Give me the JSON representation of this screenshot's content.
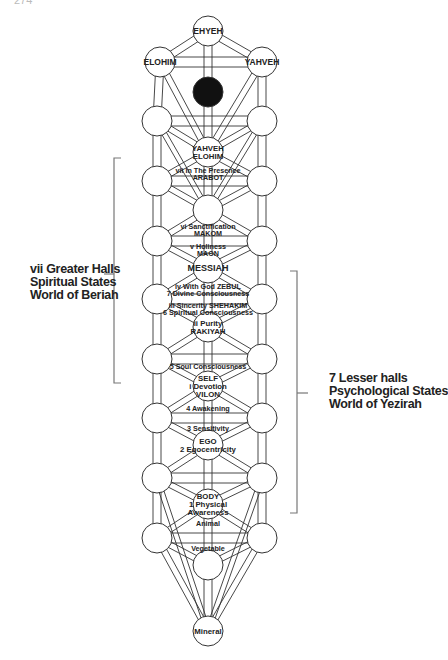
{
  "page_number": "274",
  "diagram": {
    "type": "tree-of-life",
    "top_nodes": {
      "crown": "EHYEH",
      "left": "ELOHIM",
      "right": "YAHVEH"
    },
    "center_nodes": [
      {
        "id": "yahveh-elohim",
        "lines": [
          "YAHVEH",
          "ELOHIM"
        ]
      },
      {
        "id": "blank-1",
        "lines": []
      },
      {
        "id": "messiah",
        "lines": [
          "MESSIAH"
        ]
      },
      {
        "id": "rakiyah",
        "lines": [
          "ii Purity",
          "RAKIYAH"
        ]
      },
      {
        "id": "self",
        "lines": [
          "SELF",
          "i Devotion",
          "VILON"
        ]
      },
      {
        "id": "ego",
        "lines": [
          "EGO",
          "2 Egocentricity"
        ]
      },
      {
        "id": "body",
        "lines": [
          "BODY",
          "1 Physical",
          "Awareness"
        ]
      },
      {
        "id": "blank-2",
        "lines": []
      },
      {
        "id": "mineral",
        "lines": [
          "Mineral"
        ]
      }
    ],
    "path_labels": [
      {
        "id": "arabot",
        "lines": [
          "vii In The Presence",
          "ARABOT"
        ]
      },
      {
        "id": "makom",
        "lines": [
          "vi Sanctification",
          "MAKOM"
        ]
      },
      {
        "id": "maon",
        "lines": [
          "v Holiness",
          "MAON"
        ]
      },
      {
        "id": "zebul",
        "lines": [
          "iv With God ZEBUL",
          "7 Divine Consciousness"
        ]
      },
      {
        "id": "shehakim",
        "lines": [
          "iii Sincerity SHEHAKIM",
          "6 Spiritual Consciousness"
        ]
      },
      {
        "id": "soul",
        "lines": [
          "5 Soul Consciousness"
        ]
      },
      {
        "id": "awakening",
        "lines": [
          "4 Awakening"
        ]
      },
      {
        "id": "sensitivity",
        "lines": [
          "3 Sensitivity"
        ]
      },
      {
        "id": "animal",
        "lines": [
          "Animal"
        ]
      },
      {
        "id": "vegetable",
        "lines": [
          "Vegetable"
        ]
      }
    ]
  },
  "brackets": {
    "left": {
      "lines": [
        "vii Greater Halls",
        "Spiritual States",
        "World of Beriah"
      ]
    },
    "right": {
      "lines": [
        "7 Lesser halls",
        "Psychological States",
        "World of Yezirah"
      ]
    }
  },
  "colors": {
    "line": "#333333",
    "text": "#222222",
    "dark_node": "#111111",
    "bracket": "#777777"
  }
}
